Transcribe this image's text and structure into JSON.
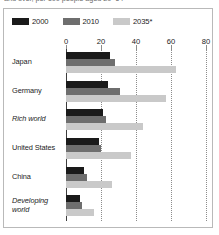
{
  "caption_clipped": "and over, per 100 people aged 20–64",
  "legend": {
    "items": [
      {
        "label": "2000",
        "color": "#1a1a1a",
        "name": "legend-swatch-2000"
      },
      {
        "label": "2010",
        "color": "#6e6e6e",
        "name": "legend-swatch-2010"
      },
      {
        "label": "2035*",
        "color": "#c9c9c9",
        "name": "legend-swatch-2035"
      }
    ]
  },
  "chart_data": {
    "type": "bar",
    "orientation": "horizontal",
    "title": "",
    "subtitle": "",
    "xlabel": "",
    "ylabel": "",
    "xlim": [
      0,
      80
    ],
    "ticks": [
      0,
      20,
      40,
      60,
      80
    ],
    "grid": true,
    "grid_style": "vertical dotted",
    "legend_position": "top-left",
    "categories": [
      "Japan",
      "Germany",
      "Rich world",
      "United States",
      "China",
      "Developing world"
    ],
    "categories_italic": [
      false,
      false,
      true,
      false,
      false,
      true
    ],
    "series": [
      {
        "name": "2000",
        "color": "#1a1a1a",
        "values": [
          25,
          24,
          21,
          19,
          10,
          8
        ]
      },
      {
        "name": "2010",
        "color": "#6e6e6e",
        "values": [
          28,
          31,
          23,
          20,
          12,
          9
        ]
      },
      {
        "name": "2035*",
        "color": "#c9c9c9",
        "values": [
          63,
          57,
          44,
          37,
          26,
          16
        ]
      }
    ]
  }
}
